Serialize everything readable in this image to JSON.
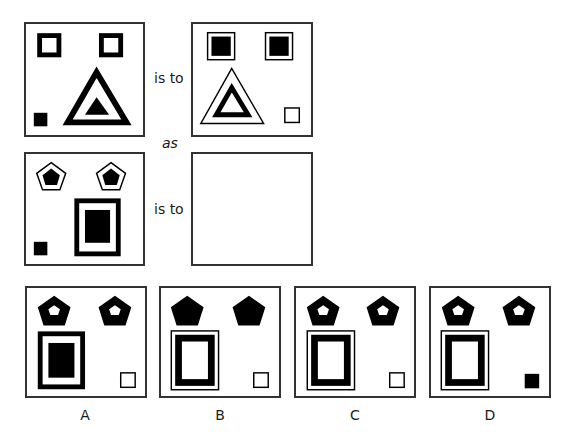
{
  "puzzle": {
    "type": "visual-analogy",
    "connector_is_to": "is to",
    "connector_as": "as",
    "row1": {
      "source": {
        "description": "Two thick-outlined hollow squares at top; bottom-left small solid black square; large triangle: thick black outline, white gap, solid black inner triangle",
        "shapes": [
          "hollow-square-thick",
          "hollow-square-thick",
          "solid-small-square",
          "triangle-thick-outline-with-solid-inner"
        ]
      },
      "target": {
        "description": "Two thin-outlined squares containing solid black squares; triangle: thin outline with thick black inner outline and white center; bottom-right small hollow square",
        "shapes": [
          "square-thin-outline-solid-inner",
          "square-thin-outline-solid-inner",
          "triangle-thin-outline-thick-inner",
          "hollow-small-square"
        ]
      }
    },
    "row2": {
      "source": {
        "description": "Two thin-outlined pentagons containing solid black pentagons; bottom-left small solid black square; rectangle: thick black frame, white gap, solid black inner rectangle",
        "shapes": [
          "pentagon-thin-outline-solid-inner",
          "pentagon-thin-outline-solid-inner",
          "solid-small-square",
          "rect-thick-frame-solid-inner"
        ]
      },
      "target": {
        "description": "Empty (answer box)",
        "shapes": []
      }
    },
    "options": [
      {
        "letter": "A",
        "shapes": [
          "pentagon-thick-black-white-center",
          "pentagon-thick-black-white-center",
          "rect-thick-frame-solid-inner",
          "hollow-small-square"
        ]
      },
      {
        "letter": "B",
        "shapes": [
          "solid-black-pentagon",
          "solid-black-pentagon",
          "rect-thin-outline-thick-frame-white-center",
          "hollow-small-square"
        ]
      },
      {
        "letter": "C",
        "shapes": [
          "pentagon-thick-black-white-center",
          "pentagon-thick-black-white-center",
          "rect-thin-outline-thick-frame-white-center",
          "hollow-small-square"
        ]
      },
      {
        "letter": "D",
        "shapes": [
          "pentagon-thick-black-white-center",
          "pentagon-thick-black-white-center",
          "rect-thin-outline-thick-frame-white-center",
          "solid-small-square"
        ]
      }
    ]
  },
  "colors": {
    "ink": "#000000",
    "frame": "#333333",
    "background": "#ffffff"
  }
}
